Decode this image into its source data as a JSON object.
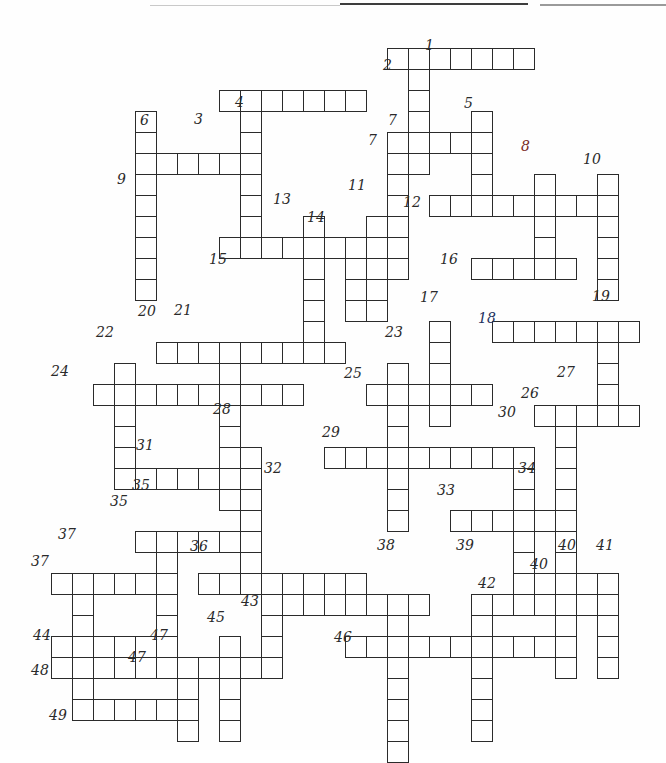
{
  "page": {
    "type": "blank hand-drawn crossword grid",
    "width": 666,
    "height": 750,
    "background_color": "#fefefe",
    "ink_color": "#2b2b2b",
    "cell_size_px": 21
  },
  "grid": {
    "cell_px": 21,
    "origin_x": 30,
    "origin_y": 48,
    "columns": 30,
    "rows": 33,
    "note": "across entries are horizontal runs, down entries are vertical runs; col/row are 0-based indices from origin"
  },
  "entries": {
    "across": [
      {
        "number": "2",
        "col": 17,
        "row": 0,
        "length": 7
      },
      {
        "number": "3",
        "col": 9,
        "row": 2,
        "length": 7
      },
      {
        "number": "7",
        "col": 17,
        "row": 4,
        "length": 4
      },
      {
        "number": "9",
        "col": 5,
        "row": 5,
        "length": 5
      },
      {
        "number": "12",
        "col": 19,
        "row": 7,
        "length": 9
      },
      {
        "number": "15",
        "col": 9,
        "row": 9,
        "length": 9
      },
      {
        "number": "16",
        "col": 21,
        "row": 10,
        "length": 5
      },
      {
        "number": "18",
        "col": 22,
        "row": 13,
        "length": 7
      },
      {
        "number": "20",
        "col": 6,
        "row": 14,
        "length": 9
      },
      {
        "number": "24",
        "col": 3,
        "row": 16,
        "length": 10
      },
      {
        "number": "25",
        "col": 16,
        "row": 16,
        "length": 6
      },
      {
        "number": "26",
        "col": 24,
        "row": 17,
        "length": 5
      },
      {
        "number": "29",
        "col": 14,
        "row": 19,
        "length": 10
      },
      {
        "number": "31",
        "col": 5,
        "row": 20,
        "length": 6
      },
      {
        "number": "33",
        "col": 20,
        "row": 22,
        "length": 6
      },
      {
        "number": "35",
        "col": 5,
        "row": 23,
        "length": 6
      },
      {
        "number": "32",
        "col": 11,
        "row": 25,
        "length": 5
      },
      {
        "number": "36",
        "col": 8,
        "row": 25,
        "length": 5
      },
      {
        "number": "37",
        "col": 1,
        "row": 25,
        "length": 6
      },
      {
        "number": "40",
        "col": 24,
        "row": 25,
        "length": 4
      },
      {
        "number": "42",
        "col": 21,
        "row": 26,
        "length": 6
      },
      {
        "number": "43",
        "col": 11,
        "row": 26,
        "length": 8
      },
      {
        "number": "44",
        "col": 1,
        "row": 28,
        "length": 5
      },
      {
        "number": "46",
        "col": 15,
        "row": 28,
        "length": 10
      },
      {
        "number": "47",
        "col": 6,
        "row": 29,
        "length": 5
      },
      {
        "number": "48",
        "col": 1,
        "row": 29,
        "length": 7
      },
      {
        "number": "49",
        "col": 2,
        "row": 31,
        "length": 6
      }
    ],
    "down": [
      {
        "number": "1",
        "col": 18,
        "row": 0,
        "length": 6
      },
      {
        "number": "4",
        "col": 10,
        "row": 2,
        "length": 8
      },
      {
        "number": "5",
        "col": 21,
        "row": 3,
        "length": 5
      },
      {
        "number": "6",
        "col": 5,
        "row": 3,
        "length": 9
      },
      {
        "number": "7",
        "col": 17,
        "row": 4,
        "length": 7
      },
      {
        "number": "8",
        "col": 24,
        "row": 6,
        "length": 5
      },
      {
        "number": "10",
        "col": 27,
        "row": 6,
        "length": 6
      },
      {
        "number": "11",
        "col": 16,
        "row": 8,
        "length": 5
      },
      {
        "number": "13",
        "col": 13,
        "row": 8,
        "length": 6
      },
      {
        "number": "14",
        "col": 15,
        "row": 9,
        "length": 4
      },
      {
        "number": "17",
        "col": 19,
        "row": 13,
        "length": 5
      },
      {
        "number": "19",
        "col": 27,
        "row": 13,
        "length": 5
      },
      {
        "number": "21",
        "col": 9,
        "row": 14,
        "length": 8
      },
      {
        "number": "22",
        "col": 4,
        "row": 15,
        "length": 6
      },
      {
        "number": "23",
        "col": 17,
        "row": 15,
        "length": 8
      },
      {
        "number": "27",
        "col": 25,
        "row": 17,
        "length": 8
      },
      {
        "number": "28",
        "col": 10,
        "row": 19,
        "length": 7
      },
      {
        "number": "30",
        "col": 23,
        "row": 19,
        "length": 5
      },
      {
        "number": "34",
        "col": 23,
        "row": 22,
        "length": 5
      },
      {
        "number": "32",
        "col": 11,
        "row": 25,
        "length": 5
      },
      {
        "number": "35",
        "col": 6,
        "row": 23,
        "length": 6
      },
      {
        "number": "37",
        "col": 2,
        "row": 25,
        "length": 6
      },
      {
        "number": "38",
        "col": 17,
        "row": 26,
        "length": 8
      },
      {
        "number": "39",
        "col": 21,
        "row": 26,
        "length": 7
      },
      {
        "number": "40",
        "col": 25,
        "row": 25,
        "length": 5
      },
      {
        "number": "41",
        "col": 27,
        "row": 25,
        "length": 5
      },
      {
        "number": "45",
        "col": 9,
        "row": 28,
        "length": 5
      },
      {
        "number": "47",
        "col": 7,
        "row": 29,
        "length": 4
      }
    ]
  },
  "labels": [
    {
      "text": "1",
      "x": 425,
      "y": 38,
      "color": "dark"
    },
    {
      "text": "2",
      "x": 383,
      "y": 58,
      "color": "dark"
    },
    {
      "text": "4",
      "x": 235,
      "y": 95,
      "color": "dark"
    },
    {
      "text": "3",
      "x": 194,
      "y": 112,
      "color": "dark"
    },
    {
      "text": "6",
      "x": 140,
      "y": 113,
      "color": "dark"
    },
    {
      "text": "5",
      "x": 464,
      "y": 96,
      "color": "dark"
    },
    {
      "text": "7",
      "x": 388,
      "y": 113,
      "color": "dark"
    },
    {
      "text": "7",
      "x": 368,
      "y": 133,
      "color": "dark"
    },
    {
      "text": "8",
      "x": 521,
      "y": 139,
      "color": "red"
    },
    {
      "text": "10",
      "x": 583,
      "y": 152,
      "color": "dark"
    },
    {
      "text": "9",
      "x": 117,
      "y": 172,
      "color": "dark"
    },
    {
      "text": "12",
      "x": 403,
      "y": 195,
      "color": "dark"
    },
    {
      "text": "11",
      "x": 348,
      "y": 178,
      "color": "dark"
    },
    {
      "text": "13",
      "x": 273,
      "y": 192,
      "color": "dark"
    },
    {
      "text": "14",
      "x": 307,
      "y": 210,
      "color": "dark"
    },
    {
      "text": "15",
      "x": 209,
      "y": 252,
      "color": "dark"
    },
    {
      "text": "16",
      "x": 440,
      "y": 252,
      "color": "dark"
    },
    {
      "text": "17",
      "x": 420,
      "y": 290,
      "color": "dark"
    },
    {
      "text": "19",
      "x": 592,
      "y": 289,
      "color": "dark"
    },
    {
      "text": "18",
      "x": 478,
      "y": 311,
      "color": "blue"
    },
    {
      "text": "20",
      "x": 138,
      "y": 304,
      "color": "dark"
    },
    {
      "text": "21",
      "x": 174,
      "y": 303,
      "color": "dark"
    },
    {
      "text": "23",
      "x": 385,
      "y": 325,
      "color": "dark"
    },
    {
      "text": "22",
      "x": 96,
      "y": 325,
      "color": "dark"
    },
    {
      "text": "25",
      "x": 344,
      "y": 366,
      "color": "dark"
    },
    {
      "text": "24",
      "x": 51,
      "y": 364,
      "color": "dark"
    },
    {
      "text": "27",
      "x": 557,
      "y": 365,
      "color": "dark"
    },
    {
      "text": "26",
      "x": 521,
      "y": 386,
      "color": "dark"
    },
    {
      "text": "28",
      "x": 213,
      "y": 402,
      "color": "dark"
    },
    {
      "text": "30",
      "x": 498,
      "y": 405,
      "color": "dark"
    },
    {
      "text": "29",
      "x": 322,
      "y": 425,
      "color": "dark"
    },
    {
      "text": "31",
      "x": 136,
      "y": 438,
      "color": "dark"
    },
    {
      "text": "34",
      "x": 518,
      "y": 461,
      "color": "dark"
    },
    {
      "text": "32",
      "x": 264,
      "y": 461,
      "color": "dark"
    },
    {
      "text": "33",
      "x": 437,
      "y": 483,
      "color": "dark"
    },
    {
      "text": "35",
      "x": 132,
      "y": 478,
      "color": "dark"
    },
    {
      "text": "35",
      "x": 110,
      "y": 494,
      "color": "dark"
    },
    {
      "text": "37",
      "x": 58,
      "y": 527,
      "color": "dark"
    },
    {
      "text": "36",
      "x": 190,
      "y": 539,
      "color": "dark"
    },
    {
      "text": "37",
      "x": 31,
      "y": 554,
      "color": "dark"
    },
    {
      "text": "38",
      "x": 377,
      "y": 538,
      "color": "dark"
    },
    {
      "text": "39",
      "x": 456,
      "y": 538,
      "color": "dark"
    },
    {
      "text": "40",
      "x": 558,
      "y": 538,
      "color": "dark"
    },
    {
      "text": "41",
      "x": 596,
      "y": 538,
      "color": "dark"
    },
    {
      "text": "40",
      "x": 530,
      "y": 557,
      "color": "dark"
    },
    {
      "text": "42",
      "x": 478,
      "y": 576,
      "color": "dark"
    },
    {
      "text": "43",
      "x": 241,
      "y": 594,
      "color": "dark"
    },
    {
      "text": "45",
      "x": 207,
      "y": 610,
      "color": "dark"
    },
    {
      "text": "47",
      "x": 150,
      "y": 628,
      "color": "dark"
    },
    {
      "text": "44",
      "x": 33,
      "y": 628,
      "color": "dark"
    },
    {
      "text": "46",
      "x": 334,
      "y": 630,
      "color": "dark"
    },
    {
      "text": "47",
      "x": 128,
      "y": 650,
      "color": "dark"
    },
    {
      "text": "48",
      "x": 31,
      "y": 663,
      "color": "dark"
    },
    {
      "text": "49",
      "x": 49,
      "y": 708,
      "color": "dark"
    }
  ],
  "colors": {
    "ink": "#2b2b2b",
    "paper": "#fefefe",
    "number_dark": "#2a2a2a",
    "number_red": "#7b2a24",
    "number_blue": "#23305e"
  }
}
